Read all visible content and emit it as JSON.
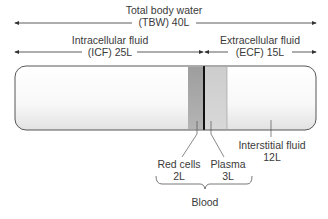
{
  "total": {
    "line1": "Total body water",
    "line2": "(TBW) 40L",
    "volume_L": 40
  },
  "icf": {
    "line1": "Intracellular fluid",
    "line2": "(ICF) 25L",
    "volume_L": 25
  },
  "ecf": {
    "line1": "Extracellular fluid",
    "line2": "(ECF) 15L",
    "volume_L": 15
  },
  "red_cells": {
    "line1": "Red cells",
    "line2": "2L",
    "volume_L": 2
  },
  "plasma": {
    "line1": "Plasma",
    "line2": "3L",
    "volume_L": 3
  },
  "interstitial": {
    "line1": "Interstitial fluid",
    "line2": "12L",
    "volume_L": 12
  },
  "blood": {
    "label": "Blood"
  },
  "colors": {
    "line": "#333333",
    "red_cells_band": "#a9a9a9",
    "plasma_band": "#cfcfcf",
    "tube_fill": "#f7f7f7"
  }
}
